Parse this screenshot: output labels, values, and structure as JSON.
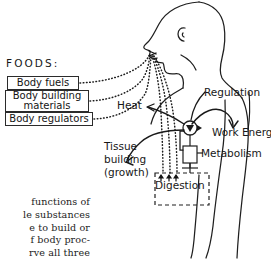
{
  "figure": {
    "name": "food-functions-body-diagram",
    "ink_color": "#1a1a1a",
    "background_color": "#ffffff"
  },
  "foods": {
    "heading": "FOODS:",
    "items": [
      {
        "label": "Body fuels"
      },
      {
        "label": "Body building\nmaterials"
      },
      {
        "label": "Body regulators"
      }
    ]
  },
  "body_diagram": {
    "heat_label": "Heat",
    "regulation_label": "Regulation",
    "work_energy_label": "Work Energy",
    "metabolism_label": "Metabolism",
    "digestion_label": "Digestion",
    "tissue_building_label": "Tissue\nbuilding\n(growth)"
  },
  "caption": {
    "text": "functions of\nle substances\ne to build or\nf body proc-\nrve all three"
  }
}
